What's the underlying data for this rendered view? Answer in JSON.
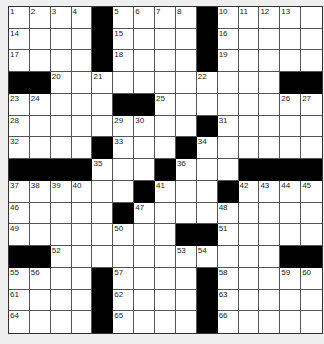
{
  "puzzle": {
    "rows": 15,
    "cols": 15,
    "colors": {
      "cell": "#ffffff",
      "block": "#000000",
      "background": "#efefef",
      "line": "#555555"
    },
    "blocks": [
      [
        1,
        5
      ],
      [
        1,
        10
      ],
      [
        2,
        5
      ],
      [
        2,
        10
      ],
      [
        3,
        5
      ],
      [
        3,
        10
      ],
      [
        4,
        1
      ],
      [
        4,
        2
      ],
      [
        4,
        14
      ],
      [
        4,
        15
      ],
      [
        5,
        6
      ],
      [
        5,
        7
      ],
      [
        6,
        10
      ],
      [
        7,
        5
      ],
      [
        7,
        9
      ],
      [
        8,
        1
      ],
      [
        8,
        2
      ],
      [
        8,
        3
      ],
      [
        8,
        4
      ],
      [
        8,
        8
      ],
      [
        8,
        12
      ],
      [
        8,
        13
      ],
      [
        8,
        14
      ],
      [
        8,
        15
      ],
      [
        9,
        7
      ],
      [
        9,
        11
      ],
      [
        10,
        6
      ],
      [
        11,
        9
      ],
      [
        11,
        10
      ],
      [
        12,
        1
      ],
      [
        12,
        2
      ],
      [
        12,
        14
      ],
      [
        12,
        15
      ],
      [
        13,
        5
      ],
      [
        13,
        10
      ],
      [
        14,
        5
      ],
      [
        14,
        10
      ],
      [
        15,
        5
      ],
      [
        15,
        10
      ]
    ],
    "numbers": [
      {
        "r": 1,
        "c": 1,
        "n": "1"
      },
      {
        "r": 1,
        "c": 2,
        "n": "2"
      },
      {
        "r": 1,
        "c": 3,
        "n": "3"
      },
      {
        "r": 1,
        "c": 4,
        "n": "4"
      },
      {
        "r": 1,
        "c": 6,
        "n": "5"
      },
      {
        "r": 1,
        "c": 7,
        "n": "6"
      },
      {
        "r": 1,
        "c": 8,
        "n": "7"
      },
      {
        "r": 1,
        "c": 9,
        "n": "8"
      },
      {
        "r": 1,
        "c": 10,
        "n": "9"
      },
      {
        "r": 1,
        "c": 11,
        "n": "10"
      },
      {
        "r": 1,
        "c": 12,
        "n": "11"
      },
      {
        "r": 1,
        "c": 13,
        "n": "12"
      },
      {
        "r": 1,
        "c": 14,
        "n": "13"
      },
      {
        "r": 2,
        "c": 1,
        "n": "14"
      },
      {
        "r": 2,
        "c": 6,
        "n": "15"
      },
      {
        "r": 2,
        "c": 11,
        "n": "16"
      },
      {
        "r": 3,
        "c": 1,
        "n": "17"
      },
      {
        "r": 3,
        "c": 6,
        "n": "18"
      },
      {
        "r": 3,
        "c": 11,
        "n": "19"
      },
      {
        "r": 4,
        "c": 3,
        "n": "20"
      },
      {
        "r": 4,
        "c": 5,
        "n": "21"
      },
      {
        "r": 4,
        "c": 10,
        "n": "22"
      },
      {
        "r": 5,
        "c": 1,
        "n": "23"
      },
      {
        "r": 5,
        "c": 2,
        "n": "24"
      },
      {
        "r": 5,
        "c": 8,
        "n": "25"
      },
      {
        "r": 5,
        "c": 14,
        "n": "26"
      },
      {
        "r": 5,
        "c": 15,
        "n": "27"
      },
      {
        "r": 6,
        "c": 1,
        "n": "28"
      },
      {
        "r": 6,
        "c": 6,
        "n": "29"
      },
      {
        "r": 6,
        "c": 7,
        "n": "30"
      },
      {
        "r": 6,
        "c": 11,
        "n": "31"
      },
      {
        "r": 7,
        "c": 1,
        "n": "32"
      },
      {
        "r": 7,
        "c": 6,
        "n": "33"
      },
      {
        "r": 7,
        "c": 10,
        "n": "34"
      },
      {
        "r": 8,
        "c": 5,
        "n": "35"
      },
      {
        "r": 8,
        "c": 9,
        "n": "36"
      },
      {
        "r": 9,
        "c": 1,
        "n": "37"
      },
      {
        "r": 9,
        "c": 2,
        "n": "38"
      },
      {
        "r": 9,
        "c": 3,
        "n": "39"
      },
      {
        "r": 9,
        "c": 4,
        "n": "40"
      },
      {
        "r": 9,
        "c": 8,
        "n": "41"
      },
      {
        "r": 9,
        "c": 12,
        "n": "42"
      },
      {
        "r": 9,
        "c": 13,
        "n": "43"
      },
      {
        "r": 9,
        "c": 14,
        "n": "44"
      },
      {
        "r": 9,
        "c": 15,
        "n": "45"
      },
      {
        "r": 10,
        "c": 1,
        "n": "46"
      },
      {
        "r": 10,
        "c": 7,
        "n": "47"
      },
      {
        "r": 10,
        "c": 11,
        "n": "48"
      },
      {
        "r": 11,
        "c": 1,
        "n": "49"
      },
      {
        "r": 11,
        "c": 6,
        "n": "50"
      },
      {
        "r": 11,
        "c": 11,
        "n": "51"
      },
      {
        "r": 12,
        "c": 3,
        "n": "52"
      },
      {
        "r": 12,
        "c": 9,
        "n": "53"
      },
      {
        "r": 12,
        "c": 10,
        "n": "54"
      },
      {
        "r": 13,
        "c": 1,
        "n": "55"
      },
      {
        "r": 13,
        "c": 2,
        "n": "56"
      },
      {
        "r": 13,
        "c": 6,
        "n": "57"
      },
      {
        "r": 13,
        "c": 11,
        "n": "58"
      },
      {
        "r": 13,
        "c": 14,
        "n": "59"
      },
      {
        "r": 13,
        "c": 15,
        "n": "60"
      },
      {
        "r": 14,
        "c": 1,
        "n": "61"
      },
      {
        "r": 14,
        "c": 6,
        "n": "62"
      },
      {
        "r": 14,
        "c": 11,
        "n": "63"
      },
      {
        "r": 15,
        "c": 1,
        "n": "64"
      },
      {
        "r": 15,
        "c": 6,
        "n": "65"
      },
      {
        "r": 15,
        "c": 11,
        "n": "66"
      }
    ]
  }
}
